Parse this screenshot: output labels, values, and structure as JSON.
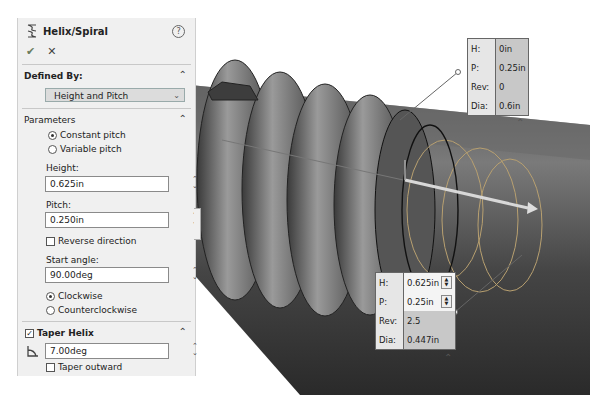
{
  "panel": {
    "title": "Helix/Spiral",
    "help_icon": "?",
    "ok_icon": "✔",
    "cancel_icon": "✕",
    "defined_by": {
      "header": "Defined By:",
      "selected": "Height and Pitch"
    },
    "parameters": {
      "header": "Parameters",
      "pitch_options": [
        "Constant pitch",
        "Variable pitch"
      ],
      "pitch_selected": "Constant pitch",
      "height_label": "Height:",
      "height_value": "0.625in",
      "pitch_label": "Pitch:",
      "pitch_value": "0.250in",
      "reverse_direction": "Reverse direction",
      "start_angle_label": "Start angle:",
      "start_angle_value": "90.00deg",
      "direction_options": [
        "Clockwise",
        "Counterclockwise"
      ],
      "direction_selected": "Clockwise"
    },
    "taper": {
      "header": "Taper Helix",
      "checked": true,
      "angle_value": "7.00deg",
      "taper_outward": "Taper outward"
    }
  },
  "callout_start": {
    "rows": [
      {
        "key": "H:",
        "value": "0in"
      },
      {
        "key": "P:",
        "value": "0.25in"
      },
      {
        "key": "Rev:",
        "value": "0"
      },
      {
        "key": "Dia:",
        "value": "0.6in"
      }
    ]
  },
  "callout_end": {
    "rows": [
      {
        "key": "H:",
        "value": "0.625in"
      },
      {
        "key": "P:",
        "value": "0.25in"
      },
      {
        "key": "Rev:",
        "value": "2.5"
      },
      {
        "key": "Dia:",
        "value": "0.447in"
      }
    ]
  },
  "colors": {
    "panel_bg": "#f0f0f0",
    "helix_preview": "#b8a060",
    "shaft": "#555555"
  }
}
